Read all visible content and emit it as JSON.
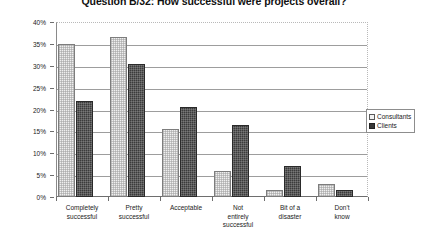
{
  "chart_data": {
    "type": "bar",
    "title": "Question B/32: How successful were projects overall?",
    "xlabel": "",
    "ylabel": "",
    "ylim": [
      0,
      40
    ],
    "ytick_labels": [
      "0%",
      "5%",
      "10%",
      "15%",
      "20%",
      "25%",
      "30%",
      "35%",
      "40%"
    ],
    "ytick_values": [
      0,
      5,
      10,
      15,
      20,
      25,
      30,
      35,
      40
    ],
    "grid": true,
    "legend_position": "right",
    "categories": [
      "Completely successful",
      "Pretty successful",
      "Acceptable",
      "Not entirely successful",
      "Bit of a disaster",
      "Don't know"
    ],
    "category_lines": [
      [
        "Completely",
        "successful"
      ],
      [
        "Pretty",
        "successful"
      ],
      [
        "Acceptable"
      ],
      [
        "Not",
        "entirely",
        "successful"
      ],
      [
        "Bit of a",
        "disaster"
      ],
      [
        "Don't",
        "know"
      ]
    ],
    "series": [
      {
        "name": "Consultants",
        "color": "#efefef",
        "values": [
          35.0,
          36.5,
          15.5,
          6.0,
          1.5,
          3.0
        ]
      },
      {
        "name": "Clients",
        "color": "#3b3b3b",
        "values": [
          22.0,
          30.5,
          20.5,
          16.5,
          7.0,
          1.5
        ]
      }
    ]
  },
  "legend": {
    "items": [
      {
        "label": "Consultants",
        "key": "consultants"
      },
      {
        "label": "Clients",
        "key": "clients"
      }
    ]
  }
}
